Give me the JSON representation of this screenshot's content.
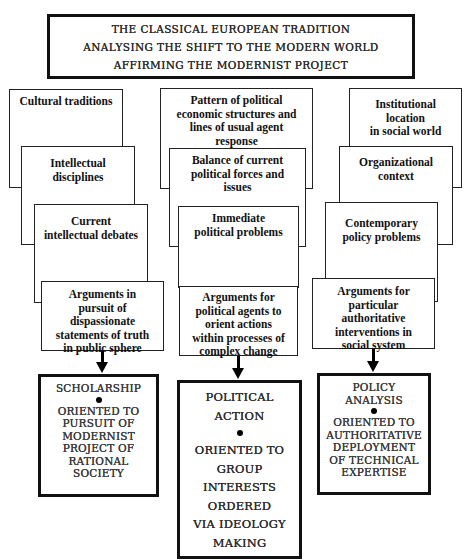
{
  "header": {
    "lines": [
      "THE CLASSICAL EUROPEAN TRADITION",
      "ANALYSING THE SHIFT TO THE MODERN WORLD",
      "AFFIRMING THE MODERNIST PROJECT"
    ]
  },
  "columns": [
    {
      "id": "scholarship",
      "tiers": [
        "Cultural traditions",
        "Intellectual\ndisciplines",
        "Current\nintellectual debates",
        "Arguments in\npursuit of\ndispassionate\nstatements of truth\nin public sphere"
      ],
      "outcome": {
        "title": "SCHOLARSHIP",
        "bullet": "•",
        "description": "ORIENTED TO\nPURSUIT OF\nMODERNIST\nPROJECT OF\nRATIONAL\nSOCIETY"
      }
    },
    {
      "id": "political-action",
      "tiers": [
        "Pattern of political\neconomic structures and\nlines of usual agent\nresponse",
        "Balance of current\npolitical forces and\nissues",
        "Immediate\npolitical problems",
        "Arguments for\npolitical agents to\norient actions\nwithin processes of\ncomplex change"
      ],
      "outcome": {
        "title": "POLITICAL\nACTION",
        "bullet": "•",
        "description": "ORIENTED TO\nGROUP\nINTERESTS\nORDERED\nVIA IDEOLOGY\nMAKING"
      }
    },
    {
      "id": "policy-analysis",
      "tiers": [
        "Institutional\nlocation\nin social world",
        "Organizational\ncontext",
        "Contemporary\npolicy problems",
        "Arguments for\nparticular\nauthoritative\ninterventions in\nsocial system"
      ],
      "outcome": {
        "title": "POLICY\nANALYSIS",
        "bullet": "•",
        "description": "ORIENTED TO\nAUTHORITATIVE\nDEPLOYMENT\nOF TECHNICAL\nEXPERTISE"
      }
    }
  ]
}
